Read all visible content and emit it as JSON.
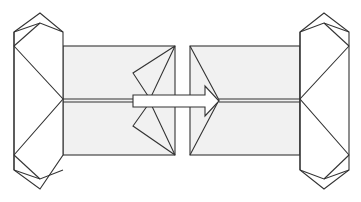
{
  "diagram": {
    "type": "origami-fold-step",
    "colors": {
      "line": "#333333",
      "panel_fill": "#f1f1f1",
      "background": "#ffffff"
    },
    "elements": [
      {
        "id": "left-unit",
        "parts": [
          "left-end-tab",
          "left-panel",
          "left-inner-flaps"
        ]
      },
      {
        "id": "right-unit",
        "parts": [
          "right-end-tab",
          "right-panel"
        ]
      },
      {
        "id": "insert-arrow",
        "direction": "right"
      }
    ]
  }
}
